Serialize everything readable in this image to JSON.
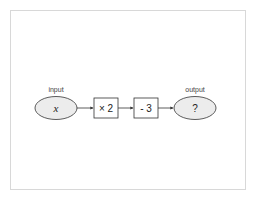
{
  "diagram": {
    "type": "flowchart",
    "input": {
      "label": "input",
      "value": "x"
    },
    "operations": [
      {
        "label": "× 2"
      },
      {
        "label": "- 3"
      }
    ],
    "output": {
      "label": "output",
      "value": "?"
    },
    "colors": {
      "node_fill": "#ececec",
      "stroke": "#333333",
      "box_fill": "#ffffff",
      "frame_border": "#d8d8d8"
    }
  }
}
